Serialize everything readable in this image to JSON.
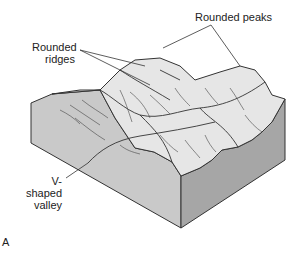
{
  "figure": {
    "panel_label": "A",
    "labels": {
      "rounded_peaks": "Rounded peaks",
      "rounded_ridges_line1": "Rounded",
      "rounded_ridges_line2": "ridges",
      "v_shaped_valley_line1": "V-shaped",
      "v_shaped_valley_line2": "valley"
    },
    "colors": {
      "top_surface": "#e6e6e6",
      "left_face": "#c9c9c9",
      "right_face": "#a6a6a6",
      "outline": "#333333",
      "background": "#ffffff"
    }
  }
}
